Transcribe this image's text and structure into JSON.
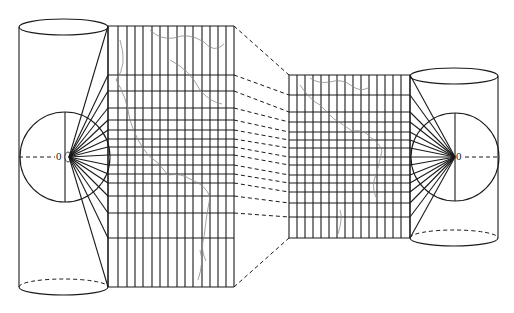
{
  "diagram": {
    "colors": {
      "line": "#1a1a1a",
      "coast": "#8a8a8a",
      "background": "#ffffff"
    },
    "left_projection": {
      "origin_label": "0",
      "cylinder": {
        "x_left": 19,
        "x_right": 108,
        "top_y": 27,
        "bottom_y": 287,
        "ellipse_ry": 8
      },
      "globe": {
        "cx": 65,
        "cy": 157,
        "r": 45
      },
      "grid": {
        "x_start": 108,
        "x_end": 234,
        "verticals": [
          108,
          118,
          127,
          135,
          143,
          152,
          160,
          168,
          177,
          185,
          193,
          202,
          210,
          218,
          226,
          234
        ],
        "horizontals": [
          26,
          75,
          91,
          108,
          120,
          130,
          139,
          147,
          155,
          165,
          174,
          183,
          196,
          213,
          238,
          287
        ]
      }
    },
    "right_projection": {
      "origin_label": "0",
      "cylinder": {
        "x_left": 410,
        "x_right": 498,
        "top_y": 76,
        "bottom_y": 238,
        "ellipse_ry": 8
      },
      "globe": {
        "cx": 455,
        "cy": 157,
        "r": 44
      },
      "grid": {
        "x_start": 289,
        "x_end": 410,
        "verticals": [
          289,
          297,
          305,
          313,
          321,
          329,
          337,
          345,
          353,
          361,
          369,
          377,
          385,
          393,
          401,
          410
        ],
        "horizontals": [
          75,
          95,
          112,
          122,
          132,
          140,
          148,
          157,
          165,
          175,
          183,
          192,
          203,
          217,
          238
        ]
      }
    }
  }
}
